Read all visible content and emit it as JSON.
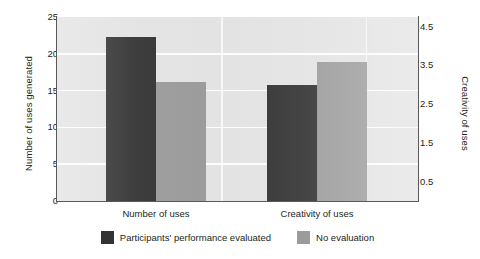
{
  "chart_data": {
    "type": "bar",
    "title": "",
    "subtitle": "",
    "categories": [
      "Number of uses",
      "Creativity of uses"
    ],
    "series": [
      {
        "name": "Participants' performance evaluated",
        "color": "#333333",
        "values": [
          22.3,
          3.0
        ],
        "axis": [
          "left",
          "right"
        ]
      },
      {
        "name": "No evaluation",
        "color": "#9b9b9b",
        "values": [
          16.2,
          3.6
        ],
        "axis": [
          "left",
          "right"
        ]
      }
    ],
    "xlabel": "",
    "ylabel_left": "Number of uses generated",
    "ylabel_right": "Creativity of uses",
    "ylim_left": [
      0,
      25
    ],
    "ylim_right": [
      0,
      4.75
    ],
    "yticks_left": [
      "25",
      "20",
      "15",
      "10",
      "5",
      "0"
    ],
    "yticks_left_values": [
      25,
      20,
      15,
      10,
      5,
      0
    ],
    "yticks_right": [
      "4.5",
      "3.5",
      "2.5",
      "1.5",
      "0.5"
    ],
    "yticks_right_values": [
      4.5,
      3.5,
      2.5,
      1.5,
      0.5
    ],
    "grid": true,
    "grid_color": "#fdfdfd",
    "plot_background": "#e3e3e3",
    "legend_position": "bottom",
    "annotations": []
  },
  "legend": {
    "entries": [
      {
        "label": "Participants' performance evaluated",
        "color": "#333333"
      },
      {
        "label": "No evaluation",
        "color": "#9b9b9b"
      }
    ]
  }
}
